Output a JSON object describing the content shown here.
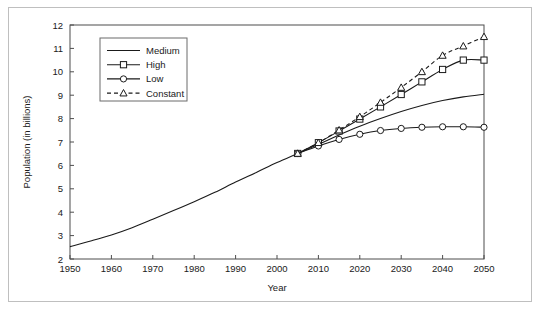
{
  "chart_data": {
    "type": "line",
    "title": "",
    "xlabel": "Year",
    "ylabel": "Population (in billions)",
    "xlim": [
      1950,
      2050
    ],
    "ylim": [
      2,
      12
    ],
    "xticks": [
      1950,
      1960,
      1970,
      1980,
      1990,
      2000,
      2010,
      2020,
      2030,
      2040,
      2050
    ],
    "yticks": [
      2,
      3,
      4,
      5,
      6,
      7,
      8,
      9,
      10,
      11,
      12
    ],
    "grid": false,
    "legend_position": "upper-left-inside",
    "series": [
      {
        "name": "Medium",
        "style": "solid",
        "marker": "none",
        "x": [
          1950,
          1955,
          1960,
          1965,
          1970,
          1975,
          1980,
          1985,
          1990,
          1995,
          2000,
          2005,
          2010,
          2015,
          2020,
          2025,
          2030,
          2035,
          2040,
          2045,
          2050
        ],
        "values": [
          2.53,
          2.77,
          3.03,
          3.34,
          3.7,
          4.07,
          4.45,
          4.85,
          5.29,
          5.7,
          6.12,
          6.51,
          6.9,
          7.3,
          7.67,
          8.0,
          8.3,
          8.56,
          8.77,
          8.93,
          9.04
        ]
      },
      {
        "name": "High",
        "style": "solid",
        "marker": "square",
        "x": [
          2005,
          2010,
          2015,
          2020,
          2025,
          2030,
          2035,
          2040,
          2045,
          2050
        ],
        "values": [
          6.51,
          6.97,
          7.47,
          7.98,
          8.5,
          9.03,
          9.57,
          10.1,
          10.5,
          10.5
        ]
      },
      {
        "name": "Low",
        "style": "solid",
        "marker": "circle",
        "x": [
          2005,
          2010,
          2015,
          2020,
          2025,
          2030,
          2035,
          2040,
          2045,
          2050
        ],
        "values": [
          6.51,
          6.83,
          7.11,
          7.33,
          7.49,
          7.58,
          7.63,
          7.65,
          7.65,
          7.63
        ]
      },
      {
        "name": "Constant",
        "style": "dashed",
        "marker": "triangle",
        "x": [
          2005,
          2010,
          2015,
          2020,
          2025,
          2030,
          2035,
          2040,
          2045,
          2050
        ],
        "values": [
          6.51,
          6.97,
          7.51,
          8.08,
          8.69,
          9.33,
          10.0,
          10.7,
          11.1,
          11.5
        ]
      }
    ]
  },
  "legend": {
    "items": [
      {
        "label": "Medium"
      },
      {
        "label": "High"
      },
      {
        "label": "Low"
      },
      {
        "label": "Constant"
      }
    ]
  },
  "axes": {
    "x_title": "Year",
    "y_title": "Population (in billions)"
  }
}
